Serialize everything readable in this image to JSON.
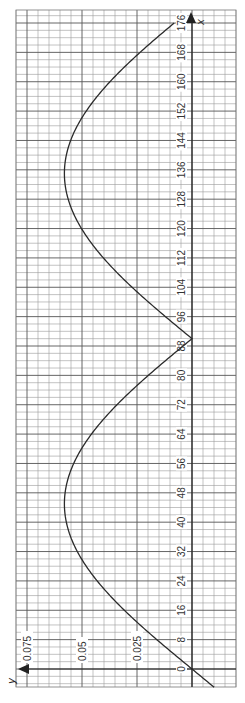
{
  "chart_data": {
    "type": "line",
    "orientation": "rotated-90-ccw",
    "title": "",
    "xlabel": "x",
    "ylabel": "y",
    "x_ticks": [
      0,
      8,
      16,
      24,
      32,
      40,
      48,
      56,
      64,
      72,
      80,
      88,
      96,
      104,
      112,
      120,
      128,
      136,
      144,
      152,
      160,
      168,
      176
    ],
    "y_ticks": [
      0.025,
      0.05,
      0.075
    ],
    "y_tick_labels": [
      "0.025",
      "0.05",
      "0.075"
    ],
    "xlim": [
      -5,
      180
    ],
    "ylim": [
      -0.02,
      0.08
    ],
    "grid": true,
    "grid_minor_x_step": 2,
    "grid_minor_y_step": 0.005,
    "legend": null,
    "series": [
      {
        "name": "y(x)",
        "description": "rectified sine wave: zero at x=0, 90, 180; humps peak at x≈45 and x≈135 with y≈0.058; dips below zero for x<0",
        "x": [
          -5,
          0,
          8,
          16,
          24,
          32,
          40,
          45,
          48,
          56,
          64,
          72,
          80,
          88,
          90,
          92,
          96,
          104,
          112,
          120,
          128,
          135,
          136,
          144,
          152,
          160,
          168,
          176
        ],
        "y": [
          -0.0101,
          0.0,
          0.0159,
          0.0296,
          0.0431,
          0.0521,
          0.0571,
          0.058,
          0.0577,
          0.0545,
          0.0479,
          0.0388,
          0.0274,
          0.0131,
          0.0,
          0.004,
          0.0121,
          0.0257,
          0.0374,
          0.0469,
          0.0534,
          0.058,
          0.0579,
          0.0553,
          0.0493,
          0.0407,
          0.0297,
          0.0081
        ]
      }
    ],
    "colors": {
      "curve": "#2a2a2a",
      "grid": "#9a9a9a",
      "grid_major": "#555555",
      "axis": "#222222"
    }
  }
}
